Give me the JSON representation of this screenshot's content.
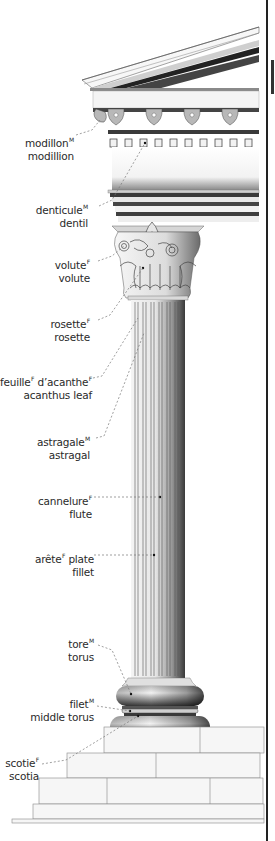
{
  "diagram": {
    "colors": {
      "line": "#222222",
      "stone": "#eeeeee",
      "shadow": "#555555",
      "leader": "#777777",
      "text": "#2a2a2a"
    },
    "labels": [
      {
        "id": "modillion",
        "fr": "modillon",
        "gender": "M",
        "en": "modillion"
      },
      {
        "id": "dentil",
        "fr": "denticule",
        "gender": "M",
        "en": "dentil"
      },
      {
        "id": "volute",
        "fr": "volute",
        "gender": "F",
        "en": "volute"
      },
      {
        "id": "rosette",
        "fr": "rosette",
        "gender": "F",
        "en": "rosette"
      },
      {
        "id": "acanthus-leaf",
        "fr_a": "feuille",
        "gender_a": "F",
        "fr_b": " d’acanthe",
        "gender_b": "F",
        "en": "acanthus leaf"
      },
      {
        "id": "astragal",
        "fr": "astragale",
        "gender": "M",
        "en": "astragal"
      },
      {
        "id": "flute",
        "fr": "cannelure",
        "gender": "F",
        "en": "flute"
      },
      {
        "id": "fillet",
        "fr_a": "arête",
        "gender_a": "F",
        "fr_b": " plate",
        "en": "fillet"
      },
      {
        "id": "torus",
        "fr": "tore",
        "gender": "M",
        "en": "torus"
      },
      {
        "id": "middle-torus",
        "fr": "filet",
        "gender": "M",
        "en": "middle torus"
      },
      {
        "id": "scotia",
        "fr": "scotie",
        "gender": "F",
        "en": "scotia"
      }
    ]
  }
}
